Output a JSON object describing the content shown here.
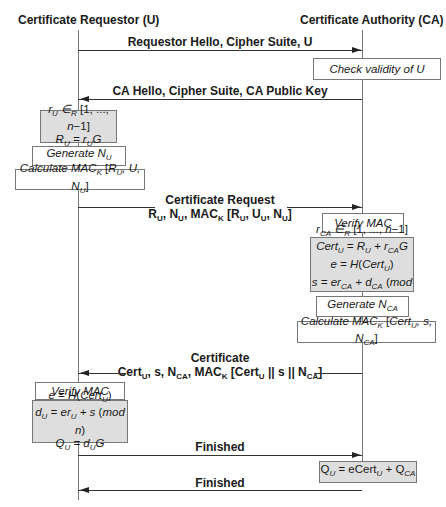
{
  "actors": {
    "left": "Certificate Requestor (U)",
    "right": "Certificate Authority (CA)"
  },
  "messages": [
    {
      "id": "m1",
      "direction": "right",
      "lines": [
        "Requestor Hello, Cipher Suite, U"
      ]
    },
    {
      "id": "m2",
      "direction": "left",
      "lines": [
        "CA Hello, Cipher Suite, CA Public Key"
      ]
    },
    {
      "id": "m3",
      "direction": "right",
      "lines": [
        "Certificate Request",
        "R_U, N_U, MAC_K [R_U, U_U, N_U]"
      ]
    },
    {
      "id": "m4",
      "direction": "left",
      "lines": [
        "Certificate",
        "Cert_U, s, N_CA, MAC_K [Cert_U || s || N_CA]"
      ]
    },
    {
      "id": "m5",
      "direction": "right",
      "lines": [
        "Finished"
      ]
    },
    {
      "id": "m6",
      "direction": "left",
      "lines": [
        "Finished"
      ]
    }
  ],
  "labels": {
    "m1": "Requestor Hello, Cipher Suite, U",
    "m2": "CA Hello, Cipher Suite, CA Public Key",
    "m3_title": "Certificate Request",
    "m4_title": "Certificate",
    "m5": "Finished",
    "m6": "Finished",
    "check_validity": "Check validity of U",
    "generate": "Generate",
    "calculate": "Calculate",
    "verify_mac": "Verify MAC"
  },
  "requestor_steps": [
    {
      "type": "gray",
      "lines": [
        "r_U ∈_R [1, ..., n−1]",
        "R_U = r_U G"
      ]
    },
    {
      "type": "white",
      "lines": [
        "Generate N_U"
      ]
    },
    {
      "type": "white",
      "lines": [
        "Calculate MAC_K [R_U, U, N_U]"
      ]
    },
    {
      "type": "white",
      "lines": [
        "Verify MAC"
      ]
    },
    {
      "type": "gray",
      "lines": [
        "e = H(Cert_U)",
        "d_U = er_U + s (mod n)",
        "Q_U = d_U G"
      ]
    }
  ],
  "ca_steps": [
    {
      "type": "white",
      "lines": [
        "Check validity of U"
      ]
    },
    {
      "type": "white",
      "lines": [
        "Verify MAC"
      ]
    },
    {
      "type": "gray",
      "lines": [
        "r_CA ∈_R [1, ..., n−1]",
        "Cert_U = R_U + r_CA G",
        "e = H(Cert_U)",
        "s = er_CA + d_CA (mod n)"
      ]
    },
    {
      "type": "white",
      "lines": [
        "Generate N_CA"
      ]
    },
    {
      "type": "white",
      "lines": [
        "Calculate MAC_K [Cert_U, s, N_CA]"
      ]
    },
    {
      "type": "gray",
      "lines": [
        "Q_U = eCert_U + Q_CA"
      ]
    }
  ],
  "colors": {
    "gray_box": "#dedede",
    "lines": "#777777",
    "text": "#1a1a1a"
  }
}
